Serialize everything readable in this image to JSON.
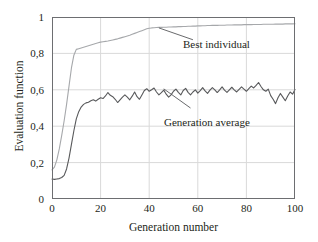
{
  "chart_data": {
    "type": "line",
    "title": "",
    "xlabel": "Generation number",
    "ylabel": "Evaluation function",
    "xlim": [
      0,
      100
    ],
    "ylim": [
      0,
      1
    ],
    "grid": true,
    "legend_position": "inline-annotations",
    "xticks": [
      "0",
      "20",
      "40",
      "60",
      "80",
      "100"
    ],
    "xtick_values": [
      0,
      20,
      40,
      60,
      80,
      100
    ],
    "yticks": [
      "0",
      "0,2",
      "0,4",
      "0,6",
      "0,8",
      "1"
    ],
    "ytick_values": [
      0,
      0.2,
      0.4,
      0.6,
      0.8,
      1
    ],
    "colors": {
      "best_individual": "#a6a8ab",
      "generation_average": "#58595b",
      "grid": "#d9d9d9",
      "frame": "#6d6e71",
      "text": "#231f20"
    },
    "annotations": [
      {
        "name": "best-individual",
        "text": "Best individual",
        "x": 44,
        "y": 0.94,
        "leader_from": [
          44,
          0.94
        ],
        "leader_to": [
          58,
          0.875
        ]
      },
      {
        "name": "generation-average",
        "text": "Generation average",
        "x": 46,
        "y": 0.605,
        "leader_from": [
          46,
          0.605
        ],
        "leader_to": [
          57,
          0.5
        ]
      }
    ],
    "series": [
      {
        "name": "Best individual",
        "color": "#a6a8ab",
        "x": [
          0,
          1,
          2,
          3,
          4,
          5,
          6,
          7,
          8,
          9,
          10,
          11,
          12,
          13,
          14,
          15,
          16,
          17,
          18,
          19,
          20,
          21,
          22,
          23,
          24,
          25,
          26,
          27,
          28,
          29,
          30,
          31,
          32,
          33,
          34,
          35,
          36,
          37,
          38,
          39,
          40,
          41,
          42,
          43,
          44,
          45,
          46,
          47,
          48,
          49,
          50,
          51,
          52,
          53,
          54,
          55,
          56,
          57,
          58,
          59,
          60,
          61,
          62,
          63,
          64,
          65,
          66,
          67,
          68,
          69,
          70,
          71,
          72,
          73,
          74,
          75,
          76,
          77,
          78,
          79,
          80,
          81,
          82,
          83,
          84,
          85,
          86,
          87,
          88,
          89,
          90,
          91,
          92,
          93,
          94,
          95,
          96,
          97,
          98,
          99,
          100
        ],
        "values": [
          0.16,
          0.175,
          0.215,
          0.275,
          0.35,
          0.43,
          0.52,
          0.62,
          0.72,
          0.79,
          0.822,
          0.826,
          0.83,
          0.834,
          0.838,
          0.842,
          0.846,
          0.85,
          0.854,
          0.858,
          0.862,
          0.864,
          0.866,
          0.868,
          0.871,
          0.874,
          0.877,
          0.88,
          0.884,
          0.888,
          0.892,
          0.896,
          0.9,
          0.905,
          0.91,
          0.915,
          0.92,
          0.925,
          0.93,
          0.935,
          0.938,
          0.94,
          0.941,
          0.942,
          0.943,
          0.943,
          0.944,
          0.944,
          0.945,
          0.945,
          0.946,
          0.946,
          0.947,
          0.947,
          0.948,
          0.948,
          0.949,
          0.949,
          0.95,
          0.95,
          0.951,
          0.951,
          0.952,
          0.952,
          0.953,
          0.953,
          0.954,
          0.954,
          0.954,
          0.955,
          0.955,
          0.955,
          0.956,
          0.956,
          0.956,
          0.957,
          0.957,
          0.957,
          0.957,
          0.958,
          0.958,
          0.958,
          0.958,
          0.959,
          0.959,
          0.959,
          0.959,
          0.96,
          0.96,
          0.96,
          0.96,
          0.96,
          0.961,
          0.961,
          0.961,
          0.961,
          0.962,
          0.962,
          0.962,
          0.962,
          0.963
        ]
      },
      {
        "name": "Generation average",
        "color": "#58595b",
        "x": [
          0,
          1,
          2,
          3,
          4,
          5,
          6,
          7,
          8,
          9,
          10,
          11,
          12,
          13,
          14,
          15,
          16,
          17,
          18,
          19,
          20,
          21,
          22,
          23,
          24,
          25,
          26,
          27,
          28,
          29,
          30,
          31,
          32,
          33,
          34,
          35,
          36,
          37,
          38,
          39,
          40,
          41,
          42,
          43,
          44,
          45,
          46,
          47,
          48,
          49,
          50,
          51,
          52,
          53,
          54,
          55,
          56,
          57,
          58,
          59,
          60,
          61,
          62,
          63,
          64,
          65,
          66,
          67,
          68,
          69,
          70,
          71,
          72,
          73,
          74,
          75,
          76,
          77,
          78,
          79,
          80,
          81,
          82,
          83,
          84,
          85,
          86,
          87,
          88,
          89,
          90,
          91,
          92,
          93,
          94,
          95,
          96,
          97,
          98,
          99,
          100
        ],
        "values": [
          0.11,
          0.108,
          0.11,
          0.112,
          0.118,
          0.13,
          0.165,
          0.225,
          0.3,
          0.375,
          0.44,
          0.48,
          0.505,
          0.52,
          0.528,
          0.532,
          0.54,
          0.545,
          0.538,
          0.548,
          0.556,
          0.552,
          0.566,
          0.585,
          0.57,
          0.562,
          0.548,
          0.53,
          0.545,
          0.56,
          0.572,
          0.56,
          0.545,
          0.565,
          0.588,
          0.562,
          0.548,
          0.572,
          0.596,
          0.606,
          0.592,
          0.6,
          0.61,
          0.588,
          0.572,
          0.584,
          0.598,
          0.576,
          0.56,
          0.572,
          0.592,
          0.604,
          0.586,
          0.572,
          0.596,
          0.608,
          0.586,
          0.572,
          0.588,
          0.6,
          0.582,
          0.596,
          0.612,
          0.594,
          0.58,
          0.598,
          0.612,
          0.6,
          0.585,
          0.6,
          0.616,
          0.598,
          0.586,
          0.6,
          0.614,
          0.6,
          0.588,
          0.602,
          0.616,
          0.604,
          0.592,
          0.606,
          0.62,
          0.61,
          0.624,
          0.64,
          0.618,
          0.6,
          0.592,
          0.604,
          0.568,
          0.548,
          0.524,
          0.556,
          0.58,
          0.56,
          0.54,
          0.566,
          0.588,
          0.576,
          0.602
        ]
      }
    ]
  }
}
